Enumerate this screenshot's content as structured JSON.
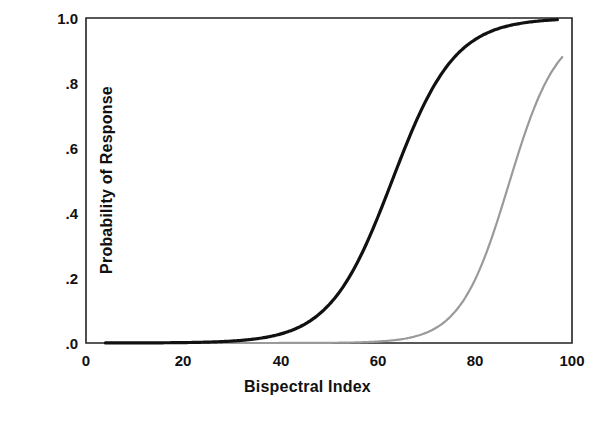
{
  "chart_data": {
    "type": "line",
    "title": "",
    "xlabel": "Bispectral Index",
    "ylabel": "Probability of Response",
    "xlim": [
      0,
      100
    ],
    "ylim": [
      0,
      1
    ],
    "grid": false,
    "legend": "none",
    "xticks": [
      0,
      20,
      40,
      60,
      80,
      100
    ],
    "xticklabels": [
      "0",
      "20",
      "40",
      "60",
      "80",
      "100"
    ],
    "yticks": [
      0,
      0.2,
      0.4,
      0.6,
      0.8,
      1.0
    ],
    "yticklabels": [
      ".0",
      ".2",
      ".4",
      ".6",
      ".8",
      "1.0"
    ],
    "series": [
      {
        "name": "black-curve",
        "color": "#111111",
        "linewidth": 3.2,
        "model": "logistic",
        "midpoint": 63,
        "slope": 0.155,
        "x": [
          4,
          10,
          20,
          30,
          35,
          40,
          43,
          46,
          49,
          52,
          55,
          58,
          61,
          63,
          65,
          68,
          71,
          74,
          77,
          80,
          83,
          86,
          90,
          93,
          97
        ],
        "y": [
          0.0001,
          0.0003,
          0.0014,
          0.0065,
          0.014,
          0.03,
          0.045,
          0.069,
          0.104,
          0.153,
          0.219,
          0.303,
          0.4,
          0.5,
          0.577,
          0.694,
          0.789,
          0.861,
          0.911,
          0.945,
          0.967,
          0.981,
          0.992,
          0.995,
          0.999
        ]
      },
      {
        "name": "gray-curve",
        "color": "#9a9a9a",
        "linewidth": 2.2,
        "model": "logistic",
        "midpoint": 87,
        "slope": 0.2,
        "x": [
          4,
          20,
          40,
          55,
          60,
          64,
          68,
          71,
          74,
          77,
          80,
          82,
          84,
          86,
          87,
          88,
          90,
          92,
          94,
          96,
          98
        ],
        "y": [
          0.0,
          0.0,
          0.0003,
          0.0016,
          0.0044,
          0.0096,
          0.021,
          0.038,
          0.067,
          0.116,
          0.196,
          0.269,
          0.354,
          0.45,
          0.5,
          0.55,
          0.646,
          0.731,
          0.804,
          0.858,
          0.88
        ]
      }
    ]
  },
  "axes": {
    "x_title": "Bispectral Index",
    "y_title": "Probability of Response",
    "x_tick_0": "0",
    "x_tick_1": "20",
    "x_tick_2": "40",
    "x_tick_3": "60",
    "x_tick_4": "80",
    "x_tick_5": "100",
    "y_tick_0": ".0",
    "y_tick_1": ".2",
    "y_tick_2": ".4",
    "y_tick_3": ".6",
    "y_tick_4": ".8",
    "y_tick_5": "1.0"
  },
  "colors": {
    "axis": "#222222",
    "series_primary": "#111111",
    "series_secondary": "#9a9a9a",
    "background": "#ffffff"
  }
}
